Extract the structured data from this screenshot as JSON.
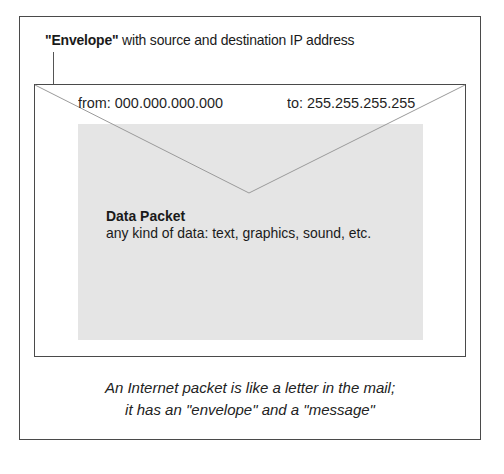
{
  "diagram": {
    "header_label": {
      "bold_part": "\"Envelope\"",
      "rest": " with source and destination IP address"
    },
    "envelope": {
      "from_label": "from: 000.000.000.000",
      "to_label": "to: 255.255.255.255"
    },
    "packet": {
      "title": "Data Packet",
      "description": "any kind of data: text, graphics, sound, etc."
    },
    "caption": {
      "line1": "An Internet packet is like a letter in the mail;",
      "line2": "it has an \"envelope\" and a \"message\""
    },
    "colors": {
      "frame": "#4a4a4a",
      "packet_fill": "#e5e5e5",
      "flap_line": "#9a9a9a",
      "text": "#1a1a1a"
    }
  }
}
